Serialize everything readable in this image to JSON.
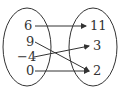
{
  "diagram": {
    "type": "mapping",
    "domain": {
      "items": [
        {
          "label": "6",
          "x": 28,
          "y": 30
        },
        {
          "label": "9",
          "x": 29,
          "y": 46
        },
        {
          "label": "−4",
          "x": 25,
          "y": 61
        },
        {
          "label": "0",
          "x": 29,
          "y": 75
        }
      ]
    },
    "range": {
      "items": [
        {
          "label": "11",
          "x": 90,
          "y": 30
        },
        {
          "label": "3",
          "x": 93,
          "y": 50
        },
        {
          "label": "2",
          "x": 93,
          "y": 74
        }
      ]
    },
    "arrows": [
      {
        "from": "6",
        "to": "11"
      },
      {
        "from": "9",
        "to": "2"
      },
      {
        "from": "−4",
        "to": "3"
      },
      {
        "from": "0",
        "to": "2"
      }
    ],
    "colors": {
      "stroke": "#333333",
      "background": "#ffffff"
    }
  }
}
